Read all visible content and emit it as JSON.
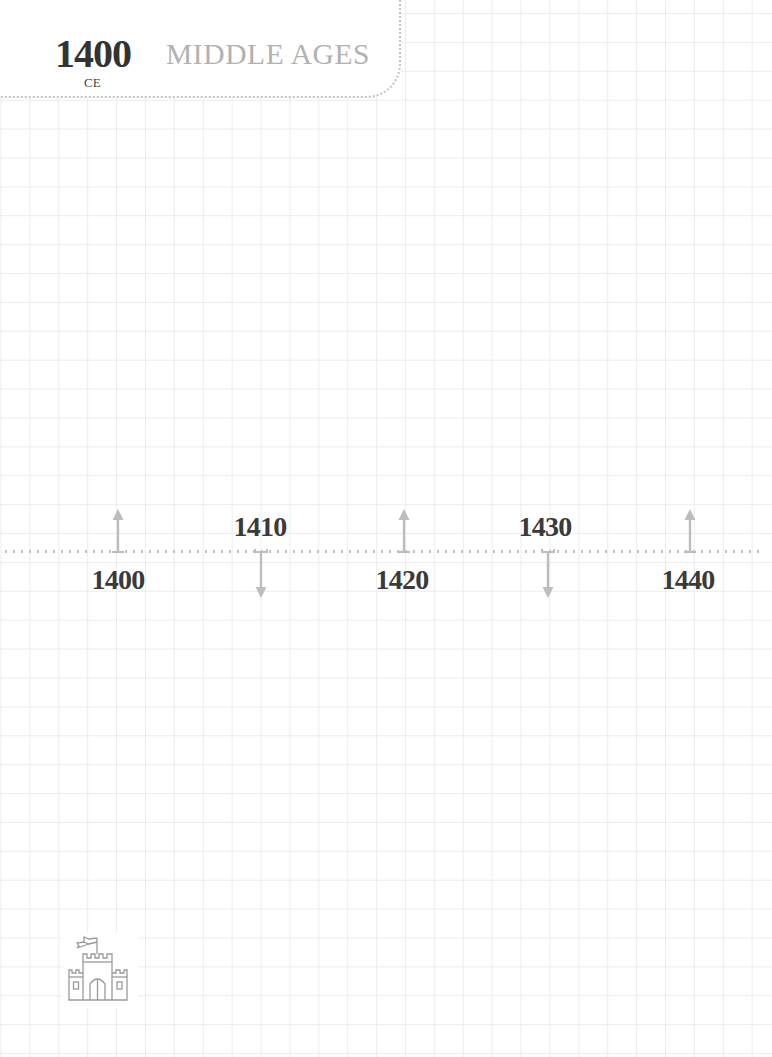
{
  "header": {
    "year": "1400",
    "era_label": "CE",
    "title": "MIDDLE AGES"
  },
  "timeline": {
    "ticks": [
      {
        "label": "1400",
        "direction": "up"
      },
      {
        "label": "1410",
        "direction": "down"
      },
      {
        "label": "1420",
        "direction": "up"
      },
      {
        "label": "1430",
        "direction": "down"
      },
      {
        "label": "1440",
        "direction": "up"
      }
    ]
  },
  "footer": {
    "icon": "castle-icon"
  },
  "colors": {
    "grid": "#ececec",
    "dots": "#c2c2c2",
    "arrow": "#bdbdbd",
    "year_text": "#333333",
    "title_text": "#b2b2b2"
  }
}
